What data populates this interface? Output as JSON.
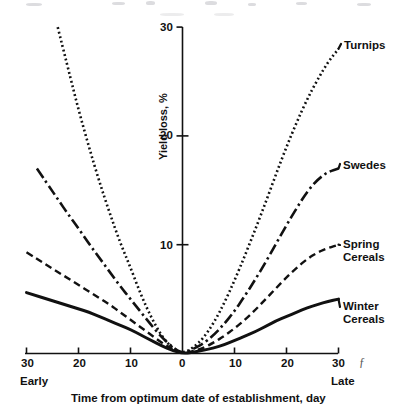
{
  "figure": {
    "background": "#ffffff",
    "ink": "#111111"
  },
  "axes": {
    "y_title": "Yield loss, %",
    "x_title": "Time from optimum date of establishment, day",
    "x_left_note": "Early",
    "x_right_note": "Late",
    "x_tick_labels": [
      "30",
      "20",
      "10",
      "0",
      "10",
      "20",
      "30"
    ],
    "y_tick_labels": [
      "10",
      "20",
      "30"
    ]
  },
  "series_labels": {
    "turnips": "Turnips",
    "swedes": "Swedes",
    "spring_cereals_line1": "Spring",
    "spring_cereals_line2": "Cereals",
    "winter_cereals_line1": "Winter",
    "winter_cereals_line2": "Cereals"
  },
  "chart_data": {
    "type": "line",
    "title": "",
    "subtitle": "",
    "xlabel": "Time from optimum date of establishment, day",
    "ylabel": "Yield loss, %",
    "xlim": [
      -30,
      30
    ],
    "ylim": [
      0,
      30
    ],
    "xticks": [
      -30,
      -20,
      -10,
      0,
      10,
      20,
      30
    ],
    "xticklabels": [
      "30",
      "20",
      "10",
      "0",
      "10",
      "20",
      "30"
    ],
    "yticks": [
      0,
      10,
      20,
      30
    ],
    "yticklabels": [
      "",
      "10",
      "20",
      "30"
    ],
    "grid": false,
    "legend": "inline-right-end-labels",
    "axis_annotations": {
      "x_left": "Early",
      "x_right": "Late"
    },
    "note": "All four curves pass through the origin (0 days, 0% yield loss). Losses rise steeply for early establishment (negative days) and more gradually for late establishment (positive days).",
    "x": [
      -30,
      -28,
      -26,
      -24,
      -22,
      -20,
      -18,
      -16,
      -14,
      -12,
      -10,
      -8,
      -6,
      -4,
      -2,
      0,
      2,
      4,
      6,
      8,
      10,
      12,
      14,
      16,
      18,
      20,
      22,
      24,
      26,
      28,
      30
    ],
    "series": [
      {
        "name": "Turnips",
        "linestyle": "dotted",
        "color": "#111111",
        "values": [
          null,
          null,
          null,
          30.0,
          26.2,
          22.4,
          19.0,
          15.8,
          12.9,
          10.2,
          7.9,
          5.4,
          3.3,
          1.6,
          0.5,
          0.0,
          0.5,
          1.4,
          2.8,
          4.6,
          6.7,
          9.0,
          11.4,
          13.9,
          16.5,
          19.0,
          21.3,
          23.4,
          25.2,
          26.8,
          28.0
        ]
      },
      {
        "name": "Swedes",
        "linestyle": "dashdot",
        "color": "#111111",
        "values": [
          null,
          17.0,
          15.6,
          14.2,
          12.8,
          11.5,
          10.1,
          8.8,
          7.5,
          6.2,
          5.0,
          3.8,
          2.6,
          1.5,
          0.6,
          0.0,
          0.4,
          0.9,
          1.7,
          2.7,
          3.9,
          5.3,
          6.8,
          8.4,
          10.1,
          11.8,
          13.4,
          14.9,
          16.0,
          16.7,
          17.0
        ]
      },
      {
        "name": "Spring Cereals",
        "linestyle": "dashed",
        "color": "#111111",
        "values": [
          9.3,
          8.7,
          8.1,
          7.5,
          6.9,
          6.3,
          5.7,
          5.1,
          4.5,
          3.8,
          3.1,
          2.4,
          1.7,
          1.0,
          0.4,
          0.0,
          0.2,
          0.5,
          1.0,
          1.6,
          2.3,
          3.1,
          4.0,
          5.0,
          6.0,
          7.0,
          7.9,
          8.7,
          9.3,
          9.7,
          10.0
        ]
      },
      {
        "name": "Winter Cereals",
        "linestyle": "solid",
        "color": "#111111",
        "values": [
          5.6,
          5.3,
          5.0,
          4.7,
          4.4,
          4.1,
          3.8,
          3.4,
          3.0,
          2.6,
          2.2,
          1.7,
          1.2,
          0.7,
          0.3,
          0.0,
          0.1,
          0.3,
          0.5,
          0.8,
          1.2,
          1.6,
          2.0,
          2.5,
          3.0,
          3.4,
          3.8,
          4.2,
          4.5,
          4.8,
          5.0
        ]
      }
    ]
  }
}
